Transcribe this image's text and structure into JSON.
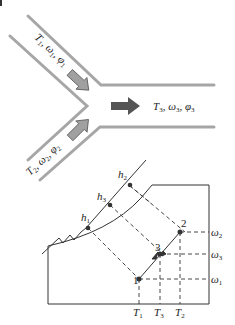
{
  "mixing_diagram": {
    "inlet1": {
      "T": "T",
      "T_sub": "1",
      "w": "ω",
      "w_sub": "1",
      "phi": "φ",
      "phi_sub": "1"
    },
    "inlet2": {
      "T": "T",
      "T_sub": "2",
      "w": "ω",
      "w_sub": "2",
      "phi": "φ",
      "phi_sub": "2"
    },
    "outlet": {
      "T": "T",
      "T_sub": "3",
      "w": "ω",
      "w_sub": "3",
      "phi": "φ",
      "phi_sub": "3"
    },
    "colors": {
      "duct": "#a6a6a6",
      "inlet_arrow": "#a0a0a0",
      "outlet_arrow": "#555555"
    }
  },
  "psychrometric_chart": {
    "enthalpy_labels": [
      {
        "h": "h",
        "sub": "2"
      },
      {
        "h": "h",
        "sub": "3"
      },
      {
        "h": "h",
        "sub": "1"
      }
    ],
    "state_points": [
      "1",
      "2",
      "3"
    ],
    "x_axis_labels": [
      {
        "T": "T",
        "sub": "1"
      },
      {
        "T": "T",
        "sub": "3"
      },
      {
        "T": "T",
        "sub": "2"
      }
    ],
    "y_axis_labels": [
      {
        "w": "ω",
        "sub": "2"
      },
      {
        "w": "ω",
        "sub": "3"
      },
      {
        "w": "ω",
        "sub": "1"
      }
    ]
  }
}
